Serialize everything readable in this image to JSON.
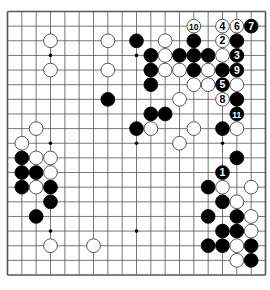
{
  "diagram": {
    "type": "go-board",
    "size": 19,
    "colors": {
      "line": "#555555",
      "black": "#000000",
      "white": "#ffffff",
      "background": "#ffffff"
    },
    "star_points": [
      [
        3,
        3
      ],
      [
        9,
        3
      ],
      [
        15,
        3
      ],
      [
        3,
        9
      ],
      [
        9,
        9
      ],
      [
        15,
        9
      ],
      [
        3,
        15
      ],
      [
        9,
        15
      ],
      [
        15,
        15
      ]
    ],
    "stones": [
      {
        "c": "B",
        "x": 17,
        "y": 1,
        "label": "7"
      },
      {
        "c": "W",
        "x": 13,
        "y": 1,
        "label": "10"
      },
      {
        "c": "W",
        "x": 15,
        "y": 1,
        "label": "4"
      },
      {
        "c": "W",
        "x": 16,
        "y": 1,
        "label": "6"
      },
      {
        "c": "W",
        "x": 3,
        "y": 2
      },
      {
        "c": "W",
        "x": 7,
        "y": 2
      },
      {
        "c": "B",
        "x": 9,
        "y": 2
      },
      {
        "c": "W",
        "x": 11,
        "y": 2
      },
      {
        "c": "B",
        "x": 13,
        "y": 2
      },
      {
        "c": "W",
        "x": 15,
        "y": 2,
        "label": "2"
      },
      {
        "c": "B",
        "x": 16,
        "y": 2
      },
      {
        "c": "B",
        "x": 10,
        "y": 3
      },
      {
        "c": "W",
        "x": 11,
        "y": 3
      },
      {
        "c": "B",
        "x": 12,
        "y": 3
      },
      {
        "c": "B",
        "x": 13,
        "y": 3
      },
      {
        "c": "B",
        "x": 14,
        "y": 3
      },
      {
        "c": "W",
        "x": 15,
        "y": 3
      },
      {
        "c": "B",
        "x": 16,
        "y": 3,
        "label": "3"
      },
      {
        "c": "W",
        "x": 3,
        "y": 4
      },
      {
        "c": "W",
        "x": 7,
        "y": 4
      },
      {
        "c": "B",
        "x": 10,
        "y": 4
      },
      {
        "c": "W",
        "x": 11,
        "y": 4
      },
      {
        "c": "W",
        "x": 12,
        "y": 4
      },
      {
        "c": "B",
        "x": 13,
        "y": 4
      },
      {
        "c": "W",
        "x": 14,
        "y": 4
      },
      {
        "c": "B",
        "x": 15,
        "y": 4
      },
      {
        "c": "B",
        "x": 16,
        "y": 4,
        "label": "9"
      },
      {
        "c": "B",
        "x": 10,
        "y": 5
      },
      {
        "c": "W",
        "x": 13,
        "y": 5
      },
      {
        "c": "W",
        "x": 14,
        "y": 5
      },
      {
        "c": "B",
        "x": 15,
        "y": 5,
        "label": "5"
      },
      {
        "c": "W",
        "x": 16,
        "y": 5
      },
      {
        "c": "B",
        "x": 7,
        "y": 6
      },
      {
        "c": "W",
        "x": 12,
        "y": 6
      },
      {
        "c": "W",
        "x": 15,
        "y": 6,
        "label": "8"
      },
      {
        "c": "B",
        "x": 16,
        "y": 6
      },
      {
        "c": "B",
        "x": 10,
        "y": 7
      },
      {
        "c": "B",
        "x": 11,
        "y": 7
      },
      {
        "c": "B",
        "x": 16,
        "y": 7,
        "label": "11"
      },
      {
        "c": "W",
        "x": 2,
        "y": 8
      },
      {
        "c": "B",
        "x": 9,
        "y": 8
      },
      {
        "c": "W",
        "x": 10,
        "y": 8
      },
      {
        "c": "W",
        "x": 13,
        "y": 8
      },
      {
        "c": "B",
        "x": 15,
        "y": 8
      },
      {
        "c": "W",
        "x": 16,
        "y": 8
      },
      {
        "c": "W",
        "x": 1,
        "y": 9
      },
      {
        "c": "W",
        "x": 12,
        "y": 9
      },
      {
        "c": "B",
        "x": 1,
        "y": 10
      },
      {
        "c": "W",
        "x": 2,
        "y": 10
      },
      {
        "c": "W",
        "x": 3,
        "y": 10
      },
      {
        "c": "B",
        "x": 16,
        "y": 10
      },
      {
        "c": "B",
        "x": 1,
        "y": 11
      },
      {
        "c": "B",
        "x": 2,
        "y": 11
      },
      {
        "c": "W",
        "x": 3,
        "y": 11
      },
      {
        "c": "B",
        "x": 15,
        "y": 11,
        "label": "1"
      },
      {
        "c": "B",
        "x": 1,
        "y": 12
      },
      {
        "c": "W",
        "x": 2,
        "y": 12
      },
      {
        "c": "B",
        "x": 3,
        "y": 12
      },
      {
        "c": "B",
        "x": 14,
        "y": 12
      },
      {
        "c": "W",
        "x": 15,
        "y": 12
      },
      {
        "c": "W",
        "x": 17,
        "y": 12
      },
      {
        "c": "B",
        "x": 3,
        "y": 13
      },
      {
        "c": "B",
        "x": 15,
        "y": 13
      },
      {
        "c": "W",
        "x": 16,
        "y": 13
      },
      {
        "c": "B",
        "x": 2,
        "y": 14
      },
      {
        "c": "B",
        "x": 14,
        "y": 14
      },
      {
        "c": "B",
        "x": 16,
        "y": 14
      },
      {
        "c": "W",
        "x": 17,
        "y": 14
      },
      {
        "c": "B",
        "x": 15,
        "y": 15
      },
      {
        "c": "B",
        "x": 16,
        "y": 15
      },
      {
        "c": "W",
        "x": 17,
        "y": 15
      },
      {
        "c": "W",
        "x": 3,
        "y": 16
      },
      {
        "c": "W",
        "x": 6,
        "y": 16
      },
      {
        "c": "B",
        "x": 14,
        "y": 16
      },
      {
        "c": "B",
        "x": 15,
        "y": 16
      },
      {
        "c": "W",
        "x": 16,
        "y": 16
      },
      {
        "c": "B",
        "x": 17,
        "y": 16
      },
      {
        "c": "W",
        "x": 16,
        "y": 17
      },
      {
        "c": "B",
        "x": 17,
        "y": 17
      }
    ]
  }
}
